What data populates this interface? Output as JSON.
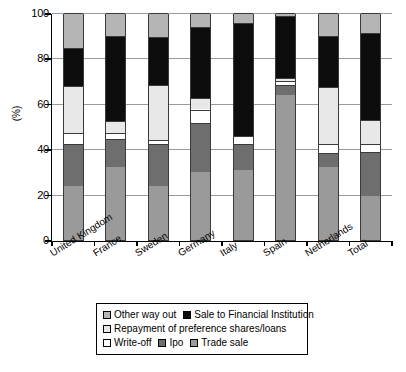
{
  "chart_data": {
    "type": "bar",
    "subtype": "stacked-bar-100-percent",
    "title": "",
    "xlabel": "",
    "ylabel": "(%)",
    "ylim": [
      0,
      100
    ],
    "yticks": [
      0,
      20,
      40,
      60,
      80,
      100
    ],
    "grid": true,
    "legend_position": "below-axes",
    "categories": [
      "United Kingdom",
      "France",
      "Sweden",
      "Germany",
      "Italy",
      "Spain",
      "Netherlands",
      "Total"
    ],
    "series": [
      {
        "name": "Trade sale",
        "color": "#9a9a9a",
        "values": [
          24.0,
          32.0,
          24.0,
          30.0,
          31.0,
          64.0,
          32.0,
          19.5
        ]
      },
      {
        "name": "Ipo",
        "color": "#6e6e6e",
        "values": [
          18.5,
          12.5,
          18.5,
          21.5,
          11.5,
          4.5,
          6.5,
          19.5
        ]
      },
      {
        "name": "Write-off",
        "color": "#ffffff",
        "values": [
          4.5,
          2.5,
          1.5,
          6.0,
          3.5,
          1.5,
          4.0,
          3.5
        ]
      },
      {
        "name": "Repayment of preference shares/loans",
        "color": "#e8e8e8",
        "values": [
          21.0,
          5.5,
          24.5,
          5.0,
          0.0,
          1.5,
          25.0,
          10.5
        ]
      },
      {
        "name": "Sale to Financial Institution",
        "color": "#0d0d0d",
        "values": [
          16.5,
          37.5,
          21.0,
          31.5,
          49.5,
          27.0,
          22.5,
          38.0
        ]
      },
      {
        "name": "Other way out",
        "color": "#b5b5b5",
        "values": [
          15.5,
          10.0,
          10.5,
          6.0,
          4.5,
          1.5,
          10.0,
          9.0
        ]
      }
    ],
    "cumulative_tops": {
      "United Kingdom": [
        24.0,
        42.5,
        47.0,
        68.0,
        84.5,
        100
      ],
      "France": [
        32.0,
        44.5,
        47.0,
        52.5,
        90.0,
        100
      ],
      "Sweden": [
        24.0,
        42.5,
        44.0,
        68.5,
        89.5,
        100
      ],
      "Germany": [
        30.0,
        51.5,
        57.5,
        62.5,
        94.0,
        100
      ],
      "Italy": [
        31.0,
        42.5,
        46.0,
        46.0,
        95.5,
        100
      ],
      "Spain": [
        64.0,
        68.5,
        70.0,
        71.5,
        98.5,
        100
      ],
      "Netherlands": [
        32.0,
        38.5,
        42.5,
        67.5,
        90.0,
        100
      ],
      "Total": [
        19.5,
        39.0,
        42.5,
        53.0,
        91.0,
        100
      ]
    }
  },
  "axis": {
    "ytick_labels": [
      "100",
      "80",
      "60",
      "40",
      "20",
      "0"
    ],
    "ylabel": "(%)"
  },
  "legend": {
    "rows": [
      [
        {
          "label": "Other way out",
          "color": "#b5b5b5"
        },
        {
          "label": "Sale to Financial Institution",
          "color": "#0d0d0d"
        }
      ],
      [
        {
          "label": "Repayment of preference shares/loans",
          "color": "#e8e8e8"
        }
      ],
      [
        {
          "label": "Write-off",
          "color": "#ffffff"
        },
        {
          "label": "Ipo",
          "color": "#6e6e6e"
        },
        {
          "label": "Trade sale",
          "color": "#9a9a9a"
        }
      ]
    ]
  }
}
